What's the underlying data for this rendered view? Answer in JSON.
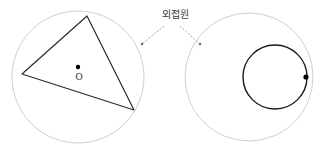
{
  "figure": {
    "title_label": "외접원",
    "center_point_label": "O",
    "canvas": {
      "width": 325,
      "height": 158,
      "background": "#ffffff"
    },
    "colors": {
      "outer_circle_stroke": "#c8c8c8",
      "triangle_stroke": "#2b2b2b",
      "inner_circle_stroke": "#1a1a1a",
      "point_fill": "#000000",
      "leader_line": "#9a9a9a",
      "label_text": "#3a3a3a"
    },
    "left_diagram": {
      "name": "triangle-inscribed-in-circle",
      "circumcircle": {
        "cx": 78,
        "cy": 77,
        "r": 66
      },
      "triangle_vertices": [
        {
          "x": 87,
          "y": 16
        },
        {
          "x": 22,
          "y": 74
        },
        {
          "x": 134,
          "y": 110
        }
      ],
      "center_dot": {
        "cx": 78,
        "cy": 67,
        "r": 2.2
      },
      "center_letter": {
        "x": 78,
        "y": 77
      }
    },
    "right_diagram": {
      "name": "circle-internally-tangent-to-circle",
      "outer_circle": {
        "cx": 249,
        "cy": 77,
        "r": 64
      },
      "inner_circle": {
        "cx": 275,
        "cy": 77,
        "r": 32
      },
      "tangent_point": {
        "cx": 306,
        "cy": 77,
        "r": 2.6
      }
    },
    "leaders": [
      {
        "name": "leader-left",
        "from": {
          "x": 164,
          "y": 26
        },
        "to": {
          "x": 142,
          "y": 44
        },
        "endpoint_dot": {
          "cx": 142,
          "cy": 44,
          "r": 1.2
        }
      },
      {
        "name": "leader-right",
        "from": {
          "x": 180,
          "y": 26
        },
        "to": {
          "x": 200,
          "y": 44
        },
        "endpoint_dot": {
          "cx": 200,
          "cy": 44,
          "r": 1.2
        }
      }
    ]
  }
}
